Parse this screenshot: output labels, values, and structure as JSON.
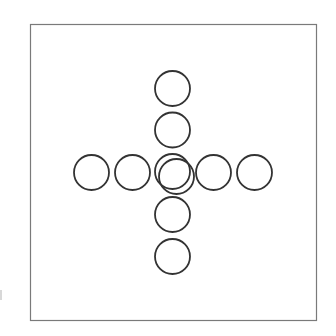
{
  "canvas": {
    "width": 336,
    "height": 336,
    "background": "#ffffff"
  },
  "frame": {
    "x": 30.5,
    "y": 24.5,
    "width": 286,
    "height": 296,
    "stroke": "#7a7a7a",
    "stroke_width": 1.2
  },
  "circles": {
    "stroke": "#333333",
    "stroke_width": 1.8,
    "radius": 17.5,
    "items": [
      {
        "id": "top-outer",
        "cx": 172.5,
        "cy": 88.5
      },
      {
        "id": "top-inner",
        "cx": 172.5,
        "cy": 130
      },
      {
        "id": "left-outer",
        "cx": 91.5,
        "cy": 172.5
      },
      {
        "id": "left-inner",
        "cx": 132.5,
        "cy": 172.5
      },
      {
        "id": "center",
        "cx": 172.5,
        "cy": 171.5
      },
      {
        "id": "center-offset",
        "cx": 176.5,
        "cy": 176.5
      },
      {
        "id": "right-inner",
        "cx": 213.5,
        "cy": 172.5
      },
      {
        "id": "right-outer",
        "cx": 254.5,
        "cy": 172.5
      },
      {
        "id": "bottom-inner",
        "cx": 172.5,
        "cy": 214.5
      },
      {
        "id": "bottom-outer",
        "cx": 172.5,
        "cy": 256.5
      }
    ]
  }
}
